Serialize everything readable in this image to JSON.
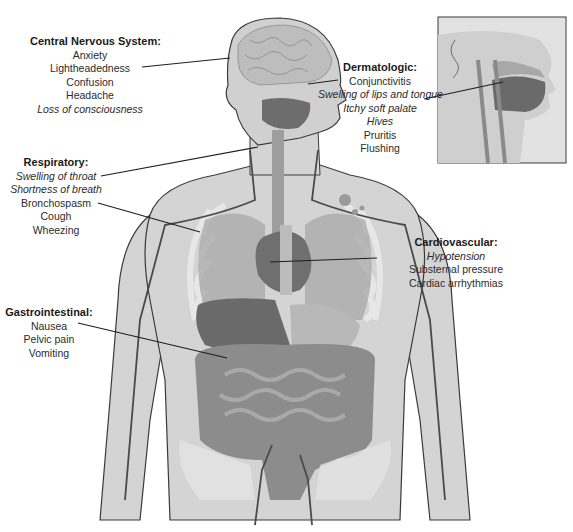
{
  "figure": {
    "colors": {
      "skin": "#d4d4d4",
      "outline": "#3a3a3a",
      "organ_dark": "#7a7a7a",
      "organ_mid": "#9e9e9e",
      "bone": "#eaeaea",
      "vessel": "#4a4a4a",
      "leader_line": "#1e1e1e",
      "text": "#2b2b2b"
    }
  },
  "labels": {
    "cns": {
      "title": "Central Nervous System:",
      "items": [
        {
          "text": "Anxiety",
          "italic": false
        },
        {
          "text": "Lightheadedness",
          "italic": false
        },
        {
          "text": "Confusion",
          "italic": false
        },
        {
          "text": "Headache",
          "italic": false
        },
        {
          "text": "Loss of consciousness",
          "italic": true
        }
      ]
    },
    "dermatologic": {
      "title": "Dermatologic:",
      "items": [
        {
          "text": "Conjunctivitis",
          "italic": false
        },
        {
          "text": "Swelling of lips and tongue",
          "italic": true
        },
        {
          "text": "Itchy soft palate",
          "italic": true
        },
        {
          "text": "Hives",
          "italic": true
        },
        {
          "text": "Pruritis",
          "italic": false
        },
        {
          "text": "Flushing",
          "italic": false
        }
      ]
    },
    "respiratory": {
      "title": "Respiratory:",
      "items": [
        {
          "text": "Swelling of throat",
          "italic": true
        },
        {
          "text": "Shortness of breath",
          "italic": true
        },
        {
          "text": "Bronchospasm",
          "italic": false
        },
        {
          "text": "Cough",
          "italic": false
        },
        {
          "text": "Wheezing",
          "italic": false
        }
      ]
    },
    "cardiovascular": {
      "title": "Cardiovascular:",
      "items": [
        {
          "text": "Hypotension",
          "italic": true
        },
        {
          "text": "Substernal pressure",
          "italic": false
        },
        {
          "text": "Cardiac arrhythmias",
          "italic": false
        }
      ]
    },
    "gastrointestinal": {
      "title": "Gastrointestinal:",
      "items": [
        {
          "text": "Nausea",
          "italic": false
        },
        {
          "text": "Pelvic pain",
          "italic": false
        },
        {
          "text": "Vomiting",
          "italic": false
        }
      ]
    }
  },
  "inset": {
    "description": "Sagittal view of head showing oral cavity and soft palate"
  }
}
